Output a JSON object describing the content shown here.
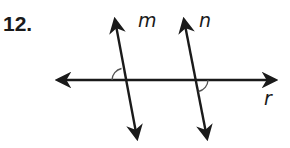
{
  "problem": {
    "number": "12."
  },
  "diagram": {
    "lines": [
      {
        "id": "m",
        "label": "m",
        "type": "line",
        "x1": 137,
        "y1": 140,
        "x2": 115,
        "y2": 18
      },
      {
        "id": "n",
        "label": "n",
        "type": "line",
        "x1": 207,
        "y1": 140,
        "x2": 184,
        "y2": 18
      },
      {
        "id": "r",
        "label": "r",
        "type": "transversal",
        "x1": 55,
        "y1": 80,
        "x2": 278,
        "y2": 80
      }
    ],
    "labels": [
      {
        "text": "m",
        "x": 138,
        "y": 26
      },
      {
        "text": "n",
        "x": 200,
        "y": 26
      },
      {
        "text": "r",
        "x": 264,
        "y": 104
      }
    ],
    "angle_marks": [
      {
        "at": "m-r intersection",
        "position": "upper-left"
      },
      {
        "at": "n-r intersection",
        "position": "lower-right"
      }
    ],
    "colors": {
      "line": "#1a1a1a",
      "arc": "#555555"
    }
  }
}
